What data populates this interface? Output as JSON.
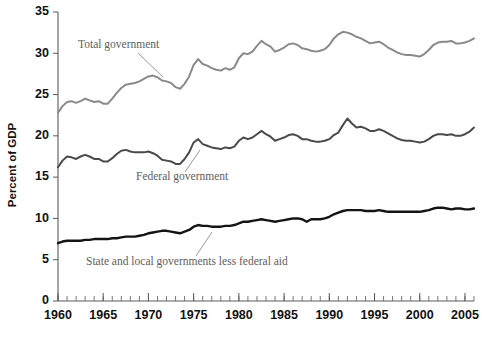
{
  "chart_data": {
    "type": "line",
    "title": "",
    "subtitle": "",
    "xlabel": "",
    "ylabel": "Percent of GDP",
    "xlim": [
      1960,
      2006
    ],
    "ylim": [
      0,
      35
    ],
    "ytick_values": [
      0,
      5,
      10,
      15,
      20,
      25,
      30,
      35
    ],
    "ytick_labels": [
      "0",
      "5",
      "10",
      "15",
      "20",
      "25",
      "30",
      "35"
    ],
    "xtick_labels": [
      "1960",
      "1965",
      "1970",
      "1975",
      "1980",
      "1985",
      "1990",
      "1995",
      "2000",
      "2005"
    ],
    "xtick_values": [
      1960,
      1965,
      1970,
      1975,
      1980,
      1985,
      1990,
      1995,
      2000,
      2005
    ],
    "x_minor_tick_step": 1,
    "grid": false,
    "legend": "annotations-inline",
    "x": [
      1960,
      1960.5,
      1961,
      1961.5,
      1962,
      1962.5,
      1963,
      1963.5,
      1964,
      1964.5,
      1965,
      1965.5,
      1966,
      1966.5,
      1967,
      1967.5,
      1968,
      1968.5,
      1969,
      1969.5,
      1970,
      1970.5,
      1971,
      1971.5,
      1972,
      1972.5,
      1973,
      1973.5,
      1974,
      1974.5,
      1975,
      1975.5,
      1976,
      1976.5,
      1977,
      1977.5,
      1978,
      1978.5,
      1979,
      1979.5,
      1980,
      1980.5,
      1981,
      1981.5,
      1982,
      1982.5,
      1983,
      1983.5,
      1984,
      1984.5,
      1985,
      1985.5,
      1986,
      1986.5,
      1987,
      1987.5,
      1988,
      1988.5,
      1989,
      1989.5,
      1990,
      1990.5,
      1991,
      1991.5,
      1992,
      1992.5,
      1993,
      1993.5,
      1994,
      1994.5,
      1995,
      1995.5,
      1996,
      1996.5,
      1997,
      1997.5,
      1998,
      1998.5,
      1999,
      1999.5,
      2000,
      2000.5,
      2001,
      2001.5,
      2002,
      2002.5,
      2003,
      2003.5,
      2004,
      2004.5,
      2005,
      2005.5,
      2006
    ],
    "series": [
      {
        "name": "Total government",
        "color": "#8a8a8a",
        "linewidth": 2.0,
        "values": [
          22.8,
          23.6,
          24.1,
          24.2,
          24.0,
          24.2,
          24.5,
          24.3,
          24.1,
          24.2,
          23.9,
          23.9,
          24.5,
          25.2,
          25.8,
          26.2,
          26.3,
          26.4,
          26.6,
          26.9,
          27.2,
          27.3,
          27.1,
          26.7,
          26.6,
          26.4,
          25.9,
          25.7,
          26.3,
          27.2,
          28.6,
          29.3,
          28.7,
          28.5,
          28.2,
          28.0,
          27.9,
          28.2,
          28.0,
          28.3,
          29.4,
          30.0,
          29.9,
          30.2,
          30.9,
          31.5,
          31.1,
          30.8,
          30.2,
          30.4,
          30.7,
          31.1,
          31.2,
          31.0,
          30.6,
          30.5,
          30.3,
          30.2,
          30.3,
          30.5,
          31.0,
          31.8,
          32.3,
          32.6,
          32.5,
          32.3,
          32.0,
          31.8,
          31.5,
          31.2,
          31.3,
          31.4,
          31.1,
          30.7,
          30.4,
          30.1,
          29.9,
          29.8,
          29.8,
          29.7,
          29.6,
          29.9,
          30.4,
          31.0,
          31.3,
          31.4,
          31.4,
          31.5,
          31.2,
          31.2,
          31.3,
          31.5,
          31.8
        ]
      },
      {
        "name": "Federal government",
        "color": "#4a4a4a",
        "linewidth": 2.0,
        "values": [
          16.2,
          17.0,
          17.5,
          17.4,
          17.2,
          17.5,
          17.7,
          17.5,
          17.2,
          17.2,
          16.9,
          16.9,
          17.3,
          17.8,
          18.2,
          18.3,
          18.1,
          18.0,
          18.0,
          18.0,
          18.1,
          17.9,
          17.6,
          17.1,
          17.0,
          16.9,
          16.6,
          16.6,
          17.2,
          18.0,
          19.2,
          19.6,
          19.0,
          18.8,
          18.6,
          18.5,
          18.4,
          18.6,
          18.5,
          18.7,
          19.4,
          19.8,
          19.6,
          19.8,
          20.2,
          20.6,
          20.2,
          19.9,
          19.4,
          19.6,
          19.8,
          20.1,
          20.2,
          20.0,
          19.6,
          19.6,
          19.4,
          19.3,
          19.3,
          19.4,
          19.6,
          20.1,
          20.4,
          21.3,
          22.1,
          21.5,
          21.0,
          21.1,
          20.9,
          20.6,
          20.6,
          20.8,
          20.6,
          20.3,
          20.0,
          19.7,
          19.5,
          19.4,
          19.4,
          19.3,
          19.2,
          19.3,
          19.6,
          20.0,
          20.2,
          20.2,
          20.1,
          20.2,
          20.0,
          20.0,
          20.2,
          20.5,
          21.0
        ]
      },
      {
        "name": "State and local governments less federal aid",
        "color": "#141414",
        "linewidth": 2.4,
        "values": [
          7.0,
          7.2,
          7.3,
          7.3,
          7.3,
          7.3,
          7.4,
          7.4,
          7.5,
          7.5,
          7.5,
          7.5,
          7.6,
          7.6,
          7.7,
          7.8,
          7.8,
          7.8,
          7.9,
          8.0,
          8.2,
          8.3,
          8.4,
          8.5,
          8.5,
          8.4,
          8.3,
          8.2,
          8.4,
          8.6,
          9.0,
          9.2,
          9.1,
          9.1,
          9.0,
          9.0,
          9.0,
          9.1,
          9.1,
          9.2,
          9.4,
          9.6,
          9.6,
          9.7,
          9.8,
          9.9,
          9.8,
          9.7,
          9.6,
          9.7,
          9.8,
          9.9,
          10.0,
          10.0,
          9.9,
          9.6,
          9.9,
          9.9,
          9.9,
          10.0,
          10.2,
          10.5,
          10.7,
          10.9,
          11.0,
          11.0,
          11.0,
          11.0,
          10.9,
          10.9,
          10.9,
          11.0,
          10.9,
          10.8,
          10.8,
          10.8,
          10.8,
          10.8,
          10.8,
          10.8,
          10.8,
          10.9,
          11.0,
          11.2,
          11.3,
          11.3,
          11.2,
          11.1,
          11.2,
          11.2,
          11.1,
          11.1,
          11.2
        ]
      }
    ],
    "annotations": [
      {
        "text": "Total government",
        "series": "Total government",
        "color": "#5e5e5e",
        "text_x": 78,
        "text_y": 48,
        "leader": [
          138,
          53,
          163,
          77
        ]
      },
      {
        "text": "Federal government",
        "series": "Federal government",
        "color": "#5e5e5e",
        "text_x": 136,
        "text_y": 180,
        "leader": [
          185,
          172,
          200,
          150
        ]
      },
      {
        "text": "State and local governments less federal aid",
        "series": "State and local governments less federal aid",
        "color": "#1a1a1a",
        "text_x": 86,
        "text_y": 265,
        "leader": [
          196,
          256,
          212,
          232
        ]
      }
    ]
  }
}
